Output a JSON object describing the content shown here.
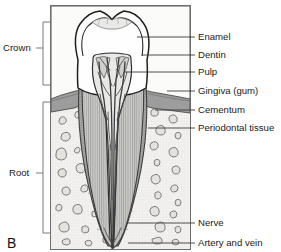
{
  "figure": {
    "panel_letter": "B",
    "colors": {
      "frame_stroke": "#6e6e6e",
      "background": "#fbfbfa",
      "enamel_fill": "#fefefe",
      "dentin_fill": "#c9c9c7",
      "pulp_fill": "#e8e8e6",
      "gingiva_fill": "#9d9d9d",
      "cementum_fill": "#a8a8a6",
      "bone_fill": "#f1f0ee",
      "vessel_dark": "#3b3b3b",
      "text": "#1a1a1a",
      "leader_line": "#3a3a3a",
      "bracket_line": "#7a7a7a"
    }
  },
  "side_labels": [
    {
      "id": "crown",
      "label": "Crown",
      "text_x": 4,
      "text_y": 48,
      "bracket_x": 50,
      "bracket_top": 22,
      "bracket_bottom": 85,
      "tick_y": 48
    },
    {
      "id": "root",
      "label": "Root",
      "text_x": 10,
      "text_y": 173,
      "bracket_x": 50,
      "bracket_top": 102,
      "bracket_bottom": 233,
      "tick_y": 173
    }
  ],
  "callouts": [
    {
      "id": "enamel",
      "label": "Enamel",
      "text_x": 198,
      "text_y": 40,
      "line_y": 37,
      "line_x1": 137,
      "line_x2": 194
    },
    {
      "id": "dentin",
      "label": "Dentin",
      "text_x": 198,
      "text_y": 58,
      "line_y": 55,
      "line_x1": 142,
      "line_x2": 194
    },
    {
      "id": "pulp",
      "label": "Pulp",
      "text_x": 198,
      "text_y": 75,
      "line_y": 72,
      "line_x1": 124,
      "line_x2": 194
    },
    {
      "id": "gingiva",
      "label": "Gingiva (gum)",
      "text_x": 198,
      "text_y": 94,
      "line_y": 91,
      "line_x1": 167,
      "line_x2": 194
    },
    {
      "id": "cementum",
      "label": "Cementum",
      "text_x": 198,
      "text_y": 113,
      "line_y": 110,
      "line_x1": 155,
      "line_x2": 194
    },
    {
      "id": "periodontal-tissue",
      "label": "Periodontal tissue",
      "text_x": 198,
      "text_y": 131,
      "line_y": 128,
      "line_x1": 148,
      "line_x2": 194
    },
    {
      "id": "nerve",
      "label": "Nerve",
      "text_x": 198,
      "text_y": 226,
      "line_y": 223,
      "line_x1": 128,
      "line_x2": 194
    },
    {
      "id": "artery-and-vein",
      "label": "Artery and vein",
      "text_x": 198,
      "text_y": 246,
      "line_y": 243,
      "line_x1": 128,
      "line_x2": 194
    }
  ],
  "frame": {
    "x": 50,
    "y": 5,
    "width": 141,
    "height": 245
  }
}
